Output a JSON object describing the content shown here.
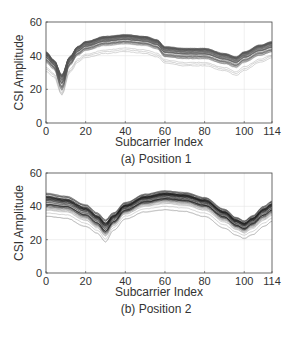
{
  "chart_data": [
    {
      "type": "line",
      "title": "(a) Position 1",
      "xlabel": "Subcarrier Index",
      "ylabel": "CSI Amplitude",
      "xlim": [
        0,
        114
      ],
      "ylim": [
        0,
        60
      ],
      "xticks": [
        0,
        20,
        40,
        60,
        80,
        100,
        114
      ],
      "yticks": [
        0,
        20,
        40,
        60
      ],
      "grid": true,
      "line_color": "#555555",
      "x": [
        0,
        4,
        8,
        12,
        16,
        20,
        30,
        40,
        50,
        56,
        60,
        70,
        80,
        90,
        96,
        100,
        108,
        114
      ],
      "band": {
        "upper": [
          43,
          38,
          30,
          40,
          46,
          49,
          52,
          53,
          52,
          50,
          46,
          45,
          45,
          42,
          40,
          43,
          47,
          49
        ],
        "center": [
          38,
          34,
          21,
          36,
          42,
          45,
          48,
          49,
          48,
          46,
          41,
          40,
          40,
          37,
          35,
          38,
          42,
          44
        ],
        "lower": [
          27,
          24,
          14,
          27,
          33,
          36,
          38,
          39,
          38,
          36,
          33,
          31,
          31,
          28,
          25,
          28,
          33,
          36
        ]
      },
      "plot_box": {
        "left": 46,
        "top": 22,
        "right": 272,
        "bottom": 123
      },
      "xlabel_pos": 146,
      "title_pos": 163
    },
    {
      "type": "line",
      "title": "(b) Position 2",
      "xlabel": "Subcarrier Index",
      "ylabel": "CSI Amplitude",
      "xlim": [
        0,
        114
      ],
      "ylim": [
        0,
        60
      ],
      "xticks": [
        0,
        20,
        40,
        60,
        80,
        100,
        114
      ],
      "yticks": [
        0,
        20,
        40,
        60
      ],
      "grid": true,
      "line_color": "#1a1a1a",
      "x": [
        0,
        10,
        20,
        26,
        30,
        34,
        40,
        50,
        60,
        70,
        80,
        90,
        96,
        100,
        104,
        110,
        114
      ],
      "band": {
        "upper": [
          49,
          47,
          42,
          37,
          33,
          37,
          43,
          48,
          50,
          49,
          46,
          39,
          34,
          32,
          35,
          41,
          44
        ],
        "center": [
          41,
          40,
          35,
          30,
          25,
          31,
          38,
          43,
          45,
          44,
          41,
          34,
          29,
          27,
          30,
          35,
          38
        ],
        "lower": [
          32,
          31,
          26,
          22,
          17,
          24,
          31,
          35,
          36,
          35,
          32,
          25,
          21,
          19,
          21,
          26,
          29
        ]
      },
      "plot_box": {
        "left": 46,
        "top": 173,
        "right": 272,
        "bottom": 273
      },
      "xlabel_pos": 296,
      "title_pos": 313
    }
  ]
}
